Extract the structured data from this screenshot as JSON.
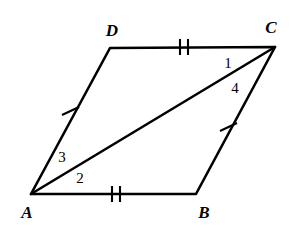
{
  "figure": {
    "background_color": "#ffffff",
    "stroke_color": "#000000",
    "width": 299,
    "height": 236
  },
  "vertices": [
    {
      "name": "A",
      "label": "A",
      "x": 31,
      "y": 194,
      "label_x": 27,
      "label_y": 212
    },
    {
      "name": "B",
      "label": "B",
      "x": 196,
      "y": 194,
      "label_x": 204,
      "label_y": 212
    },
    {
      "name": "C",
      "label": "C",
      "x": 275,
      "y": 47,
      "label_x": 271,
      "label_y": 27
    },
    {
      "name": "D",
      "label": "D",
      "x": 110,
      "y": 48,
      "label_x": 112,
      "label_y": 30
    }
  ],
  "segments": [
    {
      "name": "side-AB",
      "from": "A",
      "to": "B",
      "ticks": 2,
      "tick_x": 115,
      "tick_y": 194
    },
    {
      "name": "side-BC",
      "from": "B",
      "to": "C",
      "ticks": 1,
      "tick_x": 228,
      "tick_y": 127
    },
    {
      "name": "side-DC",
      "from": "D",
      "to": "C",
      "ticks": 2,
      "tick_x": 183,
      "tick_y": 47
    },
    {
      "name": "side-AD",
      "from": "A",
      "to": "D",
      "ticks": 1,
      "tick_x": 70,
      "tick_y": 121
    },
    {
      "name": "diagonal-AC",
      "from": "A",
      "to": "C",
      "ticks": 0
    }
  ],
  "angle_labels": [
    {
      "name": "angle-1",
      "label": "1",
      "x": 228,
      "y": 63,
      "at_vertex": "C"
    },
    {
      "name": "angle-4",
      "label": "4",
      "x": 235,
      "y": 88,
      "at_vertex": "C"
    },
    {
      "name": "angle-3",
      "label": "3",
      "x": 62,
      "y": 157,
      "at_vertex": "A"
    },
    {
      "name": "angle-2",
      "label": "2",
      "x": 80,
      "y": 178,
      "at_vertex": "A"
    }
  ]
}
